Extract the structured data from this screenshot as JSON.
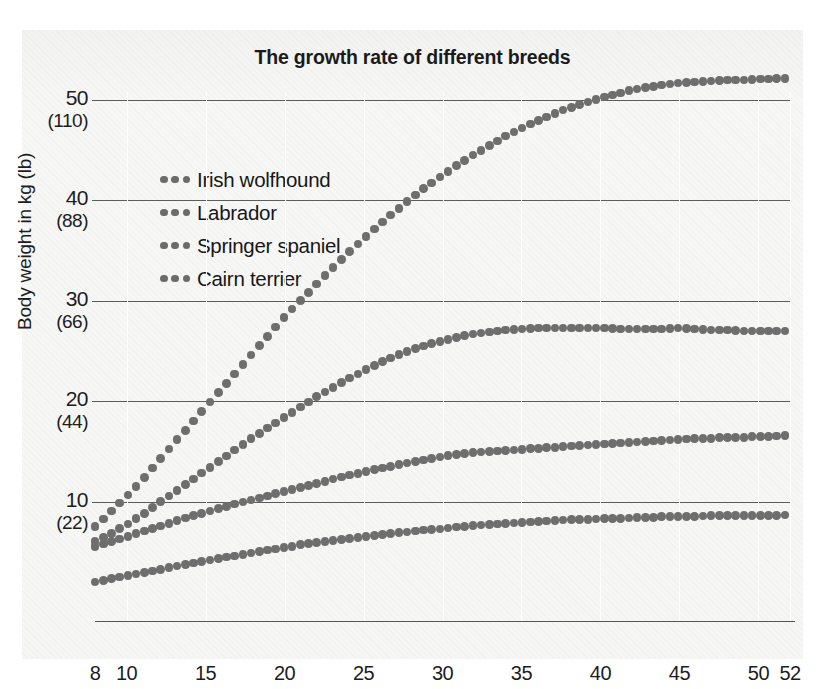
{
  "chart_data": {
    "type": "line",
    "title": "The growth rate of different breeds",
    "xlabel": "Age in weeks",
    "ylabel": "Body weight in kg (lb)",
    "xlim": [
      8,
      52
    ],
    "ylim": [
      0,
      54
    ],
    "grid": "horizontal gridlines at 10,20,30,40,50 kg; faint vertical gridlines at each x tick",
    "legend_position": "upper-left inside plot",
    "marker_style": "dotted",
    "x_ticks": [
      8,
      10,
      15,
      20,
      25,
      30,
      35,
      40,
      45,
      50,
      52
    ],
    "y_ticks_kg": [
      10,
      20,
      30,
      40,
      50
    ],
    "y_ticks_lb": [
      22,
      44,
      66,
      88,
      110
    ],
    "y_tick_labels": [
      {
        "kg": "50",
        "lb": "(110)"
      },
      {
        "kg": "40",
        "lb": "(88)"
      },
      {
        "kg": "30",
        "lb": "(66)"
      },
      {
        "kg": "20",
        "lb": "(44)"
      },
      {
        "kg": "10",
        "lb": "(22)"
      }
    ],
    "x": [
      8,
      9,
      10,
      11,
      12,
      13,
      14,
      15,
      16,
      17,
      18,
      19,
      20,
      21,
      22,
      23,
      24,
      25,
      26,
      27,
      28,
      29,
      30,
      31,
      32,
      33,
      34,
      35,
      36,
      37,
      38,
      39,
      40,
      41,
      42,
      43,
      44,
      45,
      46,
      47,
      48,
      49,
      50,
      51,
      52
    ],
    "series": [
      {
        "name": "Irish wolfhound",
        "color": "#6e6e6e",
        "values": [
          7.5,
          9.0,
          10.5,
          12.2,
          14.0,
          15.8,
          17.6,
          19.4,
          21.2,
          23.0,
          24.8,
          26.6,
          28.4,
          30.0,
          31.6,
          33.2,
          34.7,
          36.2,
          37.6,
          38.9,
          40.2,
          41.4,
          42.5,
          43.6,
          44.6,
          45.5,
          46.4,
          47.2,
          47.9,
          48.6,
          49.2,
          49.7,
          50.2,
          50.6,
          51.0,
          51.3,
          51.5,
          51.7,
          51.8,
          51.9,
          52.0,
          52.0,
          52.1,
          52.1,
          52.2
        ]
      },
      {
        "name": "Labrador",
        "color": "#6e6e6e",
        "values": [
          6.0,
          6.8,
          7.7,
          8.7,
          9.8,
          10.9,
          12.0,
          13.1,
          14.2,
          15.3,
          16.4,
          17.4,
          18.4,
          19.4,
          20.4,
          21.3,
          22.2,
          23.0,
          23.8,
          24.5,
          25.1,
          25.6,
          26.0,
          26.4,
          26.7,
          26.9,
          27.1,
          27.2,
          27.3,
          27.3,
          27.3,
          27.3,
          27.3,
          27.2,
          27.2,
          27.2,
          27.2,
          27.3,
          27.2,
          27.1,
          27.1,
          27.0,
          27.0,
          27.0,
          27.0
        ]
      },
      {
        "name": "Springer spaniel",
        "color": "#6e6e6e",
        "values": [
          5.5,
          6.0,
          6.5,
          7.0,
          7.5,
          8.0,
          8.5,
          8.9,
          9.4,
          9.8,
          10.2,
          10.6,
          11.0,
          11.4,
          11.8,
          12.2,
          12.6,
          12.9,
          13.3,
          13.6,
          13.9,
          14.2,
          14.5,
          14.7,
          14.9,
          15.0,
          15.1,
          15.2,
          15.3,
          15.4,
          15.5,
          15.6,
          15.7,
          15.8,
          15.9,
          16.0,
          16.1,
          16.2,
          16.3,
          16.3,
          16.4,
          16.4,
          16.5,
          16.5,
          16.6
        ]
      },
      {
        "name": "Cairn terrier",
        "color": "#6e6e6e",
        "values": [
          2.0,
          2.3,
          2.6,
          2.9,
          3.2,
          3.5,
          3.8,
          4.1,
          4.4,
          4.6,
          4.9,
          5.2,
          5.4,
          5.7,
          5.9,
          6.1,
          6.3,
          6.5,
          6.7,
          6.9,
          7.0,
          7.2,
          7.3,
          7.5,
          7.6,
          7.7,
          7.8,
          7.9,
          8.0,
          8.1,
          8.2,
          8.2,
          8.3,
          8.3,
          8.4,
          8.4,
          8.5,
          8.5,
          8.5,
          8.6,
          8.6,
          8.6,
          8.6,
          8.6,
          8.7
        ]
      }
    ]
  },
  "legend": {
    "items": [
      {
        "label": "Irish wolfhound"
      },
      {
        "label": "Labrador"
      },
      {
        "label": "Springer spaniel"
      },
      {
        "label": "Cairn terrier"
      }
    ]
  }
}
